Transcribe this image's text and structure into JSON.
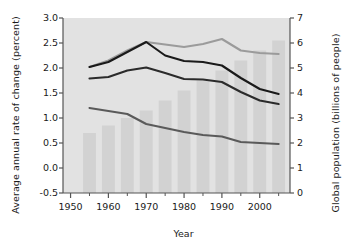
{
  "chart_data": {
    "type": "bar",
    "title": "",
    "xlabel": "Year",
    "ylabel": "Average annual rate of change (percent)",
    "ylabel_right": "Global population (billions of people)",
    "xlim": [
      1948,
      2008
    ],
    "ylim": [
      -0.5,
      3.0
    ],
    "ylim_right": [
      0,
      7
    ],
    "grid": false,
    "legend": "none",
    "x_tick_labels": [
      "1950",
      "1960",
      "1970",
      "1980",
      "1990",
      "2000"
    ],
    "x_tick_values": [
      1950,
      1960,
      1970,
      1980,
      1990,
      2000
    ],
    "x_minor_ticks": [
      1955,
      1965,
      1975,
      1985,
      1995,
      2005
    ],
    "y_tick_labels_left": [
      "3.0",
      "2.5",
      "2.0",
      "1.5",
      "1.0",
      "0.5",
      "0.0",
      "-0.5"
    ],
    "y_tick_values_left": [
      3.0,
      2.5,
      2.0,
      1.5,
      1.0,
      0.5,
      0.0,
      -0.5
    ],
    "y_tick_labels_right": [
      "7",
      "6",
      "5",
      "4",
      "3",
      "2",
      "1",
      "0"
    ],
    "y_tick_values_right": [
      7,
      6,
      5,
      4,
      3,
      2,
      1,
      0
    ],
    "bars": {
      "name": "Global population",
      "axis": "right",
      "color": "#d2d2d2",
      "categories": [
        1955,
        1960,
        1965,
        1970,
        1975,
        1980,
        1985,
        1990,
        1995,
        2000,
        2005
      ],
      "values": [
        2.4,
        2.7,
        3.0,
        3.3,
        3.7,
        4.1,
        4.5,
        4.9,
        5.3,
        5.7,
        6.1
      ]
    },
    "series": [
      {
        "name": "upper-rate-line",
        "axis": "left",
        "color": "#9b9b9b",
        "x": [
          1955,
          1960,
          1965,
          1970,
          1975,
          1980,
          1985,
          1990,
          1995,
          2000,
          2005
        ],
        "values": [
          2.02,
          2.15,
          2.35,
          2.52,
          2.47,
          2.42,
          2.48,
          2.58,
          2.35,
          2.3,
          2.28
        ]
      },
      {
        "name": "middle-rate-line",
        "axis": "left",
        "color": "#1a1a1a",
        "x": [
          1955,
          1960,
          1965,
          1970,
          1975,
          1980,
          1985,
          1990,
          1995,
          2000,
          2005
        ],
        "values": [
          2.02,
          2.12,
          2.32,
          2.52,
          2.25,
          2.14,
          2.12,
          2.05,
          1.8,
          1.58,
          1.48
        ]
      },
      {
        "name": "lower-rate-line",
        "axis": "left",
        "color": "#2b2b2b",
        "x": [
          1955,
          1960,
          1965,
          1970,
          1975,
          1980,
          1985,
          1990,
          1995,
          2000,
          2005
        ],
        "values": [
          1.79,
          1.82,
          1.95,
          2.01,
          1.9,
          1.78,
          1.77,
          1.72,
          1.52,
          1.35,
          1.28
        ]
      },
      {
        "name": "bottom-rate-line",
        "axis": "left",
        "color": "#5a5a5a",
        "x": [
          1955,
          1960,
          1965,
          1970,
          1975,
          1980,
          1985,
          1990,
          1995,
          2000,
          2005
        ],
        "values": [
          1.2,
          1.14,
          1.08,
          0.88,
          0.8,
          0.72,
          0.66,
          0.63,
          0.52,
          0.5,
          0.48
        ]
      }
    ],
    "colors": {
      "plot_background": "#e2e2e2",
      "bar_fill": "#d2d2d2",
      "axis": "#555555",
      "text": "#1a1a1a"
    }
  }
}
